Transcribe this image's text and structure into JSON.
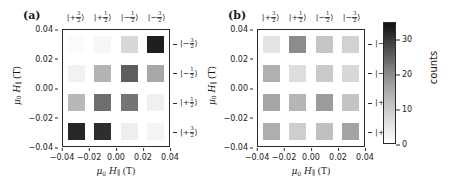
{
  "figure": {
    "panels": [
      {
        "id": "a",
        "label": "(a)",
        "xlabel_mu": "μ",
        "xlabel_sub": "0",
        "xlabel_h": "H",
        "xlabel_par": "∥",
        "xlabel_unit": "(T)",
        "ylabel_mu": "μ",
        "ylabel_sub": "0",
        "ylabel_h": "H",
        "ylabel_par": "∥",
        "ylabel_unit": "(T)",
        "xticks": [
          "-0.04",
          "-0.02",
          "0.00",
          "0.02",
          "0.04"
        ],
        "yticks": [
          "0.04",
          "0.02",
          "0.00",
          "-0.02",
          "-0.04"
        ],
        "col_labels": [
          "|+3/2>",
          "|+1/2>",
          "|-1/2>",
          "|-3/2>"
        ],
        "row_labels": [
          "|-3/2>",
          "|-1/2>",
          "|+1/2>",
          "|+3/2>"
        ]
      },
      {
        "id": "b",
        "label": "(b)",
        "xlabel_mu": "μ",
        "xlabel_sub": "0",
        "xlabel_h": "H",
        "xlabel_par": "∥",
        "xlabel_unit": "(T)",
        "ylabel_mu": "μ",
        "ylabel_sub": "0",
        "ylabel_h": "H",
        "ylabel_par": "∥",
        "ylabel_unit": "(T)",
        "xticks": [
          "-0.04",
          "-0.02",
          "0.00",
          "0.02",
          "0.04"
        ],
        "yticks": [
          "0.04",
          "0.02",
          "0.00",
          "-0.02",
          "-0.04"
        ],
        "col_labels": [
          "|+3/2>",
          "|+1/2>",
          "|-1/2>",
          "|-3/2>"
        ],
        "row_labels": [
          "|-3/2>",
          "|-1/2>",
          "|+1/2>",
          "|+3/2>"
        ]
      }
    ],
    "colorbar": {
      "title": "counts",
      "ticks": [
        "30",
        "20",
        "10",
        "0"
      ],
      "tick_values": [
        30,
        20,
        10,
        0
      ],
      "vmin": 0,
      "vmax": 35,
      "low_color": "#ffffff",
      "high_color": "#141414"
    }
  },
  "chart_data": [
    {
      "type": "heatmap",
      "panel": "a",
      "title": "(a)",
      "xlabel": "μ0 H∥ (T)",
      "ylabel": "μ0 H∥ (T)",
      "xticklabels": [
        "-0.04",
        "-0.02",
        "0.00",
        "0.02",
        "0.04"
      ],
      "yticklabels": [
        "0.04",
        "0.02",
        "0.00",
        "-0.02",
        "-0.04"
      ],
      "xlim": [
        -0.05,
        0.05
      ],
      "ylim": [
        -0.05,
        0.05
      ],
      "column_states": [
        "|+3/2>",
        "|+1/2>",
        "|-1/2>",
        "|-3/2>"
      ],
      "row_states": [
        "|-3/2>",
        "|-1/2>",
        "|+1/2>",
        "|+3/2>"
      ],
      "cell_x": [
        -0.035,
        -0.012,
        0.012,
        0.035
      ],
      "cell_y": [
        0.035,
        0.012,
        -0.012,
        -0.035
      ],
      "colorbar_label": "counts",
      "zlim": [
        0,
        35
      ],
      "grid": false,
      "values": [
        [
          1,
          2,
          9,
          33
        ],
        [
          3,
          14,
          27,
          16
        ],
        [
          13,
          24,
          23,
          3
        ],
        [
          32,
          30,
          4,
          2
        ]
      ],
      "colors": [
        [
          "#fbfbfb",
          "#f7f7f7",
          "#d8d8d8",
          "#1f1f1f"
        ],
        [
          "#f2f2f2",
          "#b4b4b4",
          "#5e5e5e",
          "#a8a8a8"
        ],
        [
          "#b8b8b8",
          "#6e6e6e",
          "#747474",
          "#f0f0f0"
        ],
        [
          "#262626",
          "#2e2e2e",
          "#eeeeee",
          "#f4f4f4"
        ]
      ]
    },
    {
      "type": "heatmap",
      "panel": "b",
      "title": "(b)",
      "xlabel": "μ0 H∥ (T)",
      "ylabel": "μ0 H∥ (T)",
      "xticklabels": [
        "-0.04",
        "-0.02",
        "0.00",
        "0.02",
        "0.04"
      ],
      "yticklabels": [
        "0.04",
        "0.02",
        "0.00",
        "-0.02",
        "-0.04"
      ],
      "xlim": [
        -0.05,
        0.05
      ],
      "ylim": [
        -0.05,
        0.05
      ],
      "column_states": [
        "|+3/2>",
        "|+1/2>",
        "|-1/2>",
        "|-3/2>"
      ],
      "row_states": [
        "|-3/2>",
        "|-1/2>",
        "|+1/2>",
        "|+3/2>"
      ],
      "cell_x": [
        -0.035,
        -0.012,
        0.012,
        0.035
      ],
      "cell_y": [
        0.035,
        0.012,
        -0.012,
        -0.035
      ],
      "colorbar_label": "counts",
      "zlim": [
        0,
        35
      ],
      "grid": false,
      "values": [
        [
          6,
          21,
          12,
          10
        ],
        [
          15,
          7,
          11,
          8
        ],
        [
          17,
          14,
          19,
          12
        ],
        [
          16,
          9,
          12,
          17
        ]
      ],
      "colors": [
        [
          "#e4e4e4",
          "#8c8c8c",
          "#c6c6c6",
          "#d2d2d2"
        ],
        [
          "#b0b0b0",
          "#dedede",
          "#cacaca",
          "#d8d8d8"
        ],
        [
          "#a6a6a6",
          "#b6b6b6",
          "#9c9c9c",
          "#c4c4c4"
        ],
        [
          "#aeaeae",
          "#cececc",
          "#c0c0c0",
          "#a4a4a4"
        ]
      ]
    }
  ]
}
